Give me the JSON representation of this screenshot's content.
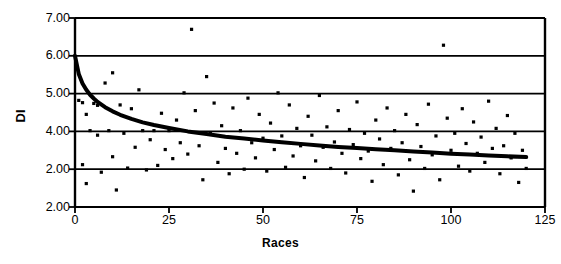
{
  "chart_data": {
    "type": "scatter",
    "title": "",
    "xlabel": "Races",
    "ylabel": "DI",
    "xlim": [
      0,
      125
    ],
    "ylim": [
      2,
      7
    ],
    "grid": true,
    "legend": false,
    "x_ticks": [
      0,
      25,
      50,
      75,
      100,
      125
    ],
    "x_tick_labels": [
      "0",
      "25",
      "50",
      "75",
      "100",
      "125"
    ],
    "y_ticks": [
      7,
      6,
      5,
      4,
      3,
      2
    ],
    "y_tick_labels": [
      "7.00",
      "6.00",
      "5.00",
      "4.00",
      "2.00",
      "2.00"
    ],
    "marker": "small-filled-square",
    "marker_color": "#000000",
    "series": [
      {
        "name": "DI observations",
        "type": "scatter",
        "points": [
          [
            1,
            4.82
          ],
          [
            2,
            4.76
          ],
          [
            2,
            3.12
          ],
          [
            3,
            4.45
          ],
          [
            3,
            2.62
          ],
          [
            4,
            4.02
          ],
          [
            5,
            4.74
          ],
          [
            6,
            4.69
          ],
          [
            6,
            3.9
          ],
          [
            7,
            2.92
          ],
          [
            8,
            5.28
          ],
          [
            9,
            4.02
          ],
          [
            10,
            5.55
          ],
          [
            10,
            3.33
          ],
          [
            11,
            2.45
          ],
          [
            12,
            4.7
          ],
          [
            13,
            3.95
          ],
          [
            14,
            3.03
          ],
          [
            15,
            4.6
          ],
          [
            16,
            3.58
          ],
          [
            17,
            5.1
          ],
          [
            18,
            4.02
          ],
          [
            19,
            2.98
          ],
          [
            20,
            3.78
          ],
          [
            21,
            4.02
          ],
          [
            22,
            3.1
          ],
          [
            23,
            4.48
          ],
          [
            24,
            3.52
          ],
          [
            25,
            4.02
          ],
          [
            26,
            3.28
          ],
          [
            27,
            4.3
          ],
          [
            28,
            3.7
          ],
          [
            29,
            5.02
          ],
          [
            30,
            3.4
          ],
          [
            31,
            6.7
          ],
          [
            32,
            4.55
          ],
          [
            33,
            3.62
          ],
          [
            34,
            2.72
          ],
          [
            35,
            5.45
          ],
          [
            36,
            3.95
          ],
          [
            37,
            4.75
          ],
          [
            38,
            3.18
          ],
          [
            39,
            4.15
          ],
          [
            40,
            3.55
          ],
          [
            41,
            2.88
          ],
          [
            42,
            4.62
          ],
          [
            43,
            3.42
          ],
          [
            44,
            4.02
          ],
          [
            45,
            3.0
          ],
          [
            46,
            4.88
          ],
          [
            47,
            3.7
          ],
          [
            48,
            3.3
          ],
          [
            49,
            4.45
          ],
          [
            50,
            3.82
          ],
          [
            51,
            2.95
          ],
          [
            52,
            4.22
          ],
          [
            53,
            3.52
          ],
          [
            54,
            5.02
          ],
          [
            55,
            3.88
          ],
          [
            56,
            3.05
          ],
          [
            57,
            4.7
          ],
          [
            58,
            3.35
          ],
          [
            59,
            4.08
          ],
          [
            60,
            3.62
          ],
          [
            61,
            2.78
          ],
          [
            62,
            4.4
          ],
          [
            63,
            3.9
          ],
          [
            64,
            3.22
          ],
          [
            65,
            4.95
          ],
          [
            66,
            3.58
          ],
          [
            67,
            4.12
          ],
          [
            68,
            3.02
          ],
          [
            69,
            3.72
          ],
          [
            70,
            4.55
          ],
          [
            71,
            3.42
          ],
          [
            72,
            2.9
          ],
          [
            73,
            4.05
          ],
          [
            74,
            3.65
          ],
          [
            75,
            4.78
          ],
          [
            76,
            3.28
          ],
          [
            77,
            3.95
          ],
          [
            78,
            3.48
          ],
          [
            79,
            2.68
          ],
          [
            80,
            4.3
          ],
          [
            81,
            3.8
          ],
          [
            82,
            3.12
          ],
          [
            83,
            4.62
          ],
          [
            84,
            3.55
          ],
          [
            85,
            4.02
          ],
          [
            86,
            2.85
          ],
          [
            87,
            3.7
          ],
          [
            88,
            4.45
          ],
          [
            89,
            3.25
          ],
          [
            90,
            2.42
          ],
          [
            91,
            4.18
          ],
          [
            92,
            3.6
          ],
          [
            93,
            3.02
          ],
          [
            94,
            4.72
          ],
          [
            95,
            3.38
          ],
          [
            96,
            3.88
          ],
          [
            97,
            2.72
          ],
          [
            98,
            6.28
          ],
          [
            99,
            4.35
          ],
          [
            100,
            3.5
          ],
          [
            101,
            3.95
          ],
          [
            102,
            3.08
          ],
          [
            103,
            4.6
          ],
          [
            104,
            3.68
          ],
          [
            105,
            2.95
          ],
          [
            106,
            4.25
          ],
          [
            107,
            3.42
          ],
          [
            108,
            3.85
          ],
          [
            109,
            3.18
          ],
          [
            110,
            4.8
          ],
          [
            111,
            3.55
          ],
          [
            112,
            4.08
          ],
          [
            113,
            2.88
          ],
          [
            114,
            3.62
          ],
          [
            115,
            4.42
          ],
          [
            116,
            3.3
          ],
          [
            117,
            3.95
          ],
          [
            118,
            2.65
          ],
          [
            119,
            3.5
          ],
          [
            120,
            3.02
          ]
        ]
      },
      {
        "name": "fitted decay curve",
        "type": "line",
        "line_color": "#000000",
        "line_width": 4,
        "fit": "power-decay",
        "points": [
          [
            0,
            6.0
          ],
          [
            1,
            5.52
          ],
          [
            2,
            5.27
          ],
          [
            3,
            5.1
          ],
          [
            4,
            4.97
          ],
          [
            5,
            4.87
          ],
          [
            6,
            4.78
          ],
          [
            8,
            4.64
          ],
          [
            10,
            4.53
          ],
          [
            12,
            4.44
          ],
          [
            15,
            4.33
          ],
          [
            18,
            4.24
          ],
          [
            21,
            4.17
          ],
          [
            25,
            4.09
          ],
          [
            30,
            4.0
          ],
          [
            35,
            3.93
          ],
          [
            40,
            3.86
          ],
          [
            45,
            3.81
          ],
          [
            50,
            3.76
          ],
          [
            55,
            3.71
          ],
          [
            60,
            3.67
          ],
          [
            65,
            3.63
          ],
          [
            70,
            3.59
          ],
          [
            75,
            3.56
          ],
          [
            80,
            3.53
          ],
          [
            85,
            3.5
          ],
          [
            90,
            3.47
          ],
          [
            95,
            3.44
          ],
          [
            100,
            3.41
          ],
          [
            105,
            3.39
          ],
          [
            110,
            3.36
          ],
          [
            115,
            3.34
          ],
          [
            120,
            3.32
          ]
        ]
      }
    ]
  },
  "axes": {
    "xlabel": "Races",
    "ylabel": "DI"
  }
}
